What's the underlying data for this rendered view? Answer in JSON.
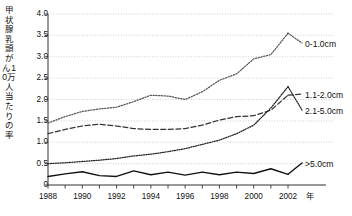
{
  "chart_data": {
    "type": "line",
    "title": "",
    "xlabel": "年",
    "ylabel": "甲状腺乳頭がん10万人当たりの率",
    "xlim": [
      1988,
      2002
    ],
    "ylim": [
      0,
      4.0
    ],
    "ytick_labels": [
      "4.0",
      "3.5",
      "3.0",
      "2.5",
      "2.0",
      "1.5",
      "1.0",
      "0.5",
      "0"
    ],
    "ytick_values": [
      4.0,
      3.5,
      3.0,
      2.5,
      2.0,
      1.5,
      1.0,
      0.5,
      0
    ],
    "xtick_labels": [
      "1988",
      "1990",
      "1992",
      "1994",
      "1996",
      "1998",
      "2000",
      "2002"
    ],
    "xtick_values": [
      1988,
      1990,
      1992,
      1994,
      1996,
      1998,
      2000,
      2002
    ],
    "grid": true,
    "grid_style": "dotted-horizontal",
    "legend_position": "right-inline",
    "x": [
      1988,
      1989,
      1990,
      1991,
      1992,
      1993,
      1994,
      1995,
      1996,
      1997,
      1998,
      1999,
      2000,
      2001,
      2002
    ],
    "series": [
      {
        "name": "0-1.0cm",
        "line_style": "dotted",
        "color": "#555555",
        "values": [
          1.45,
          1.6,
          1.72,
          1.78,
          1.82,
          1.95,
          2.1,
          2.08,
          2.0,
          2.18,
          2.45,
          2.6,
          2.95,
          3.05,
          3.55
        ]
      },
      {
        "name": "1.1-2.0cm",
        "line_style": "dashed",
        "color": "#333333",
        "values": [
          1.2,
          1.3,
          1.38,
          1.42,
          1.38,
          1.32,
          1.3,
          1.3,
          1.32,
          1.4,
          1.52,
          1.6,
          1.62,
          1.75,
          2.1
        ]
      },
      {
        "name": "2.1-5.0cm",
        "line_style": "fine-dotted",
        "color": "#222222",
        "values": [
          0.5,
          0.52,
          0.55,
          0.58,
          0.62,
          0.68,
          0.72,
          0.78,
          0.85,
          0.95,
          1.05,
          1.2,
          1.4,
          1.8,
          2.3
        ]
      },
      {
        "name": ">5.0cm",
        "line_style": "solid",
        "color": "#111111",
        "values": [
          0.2,
          0.26,
          0.31,
          0.22,
          0.2,
          0.33,
          0.24,
          0.3,
          0.23,
          0.3,
          0.24,
          0.3,
          0.27,
          0.38,
          0.25
        ]
      }
    ]
  }
}
